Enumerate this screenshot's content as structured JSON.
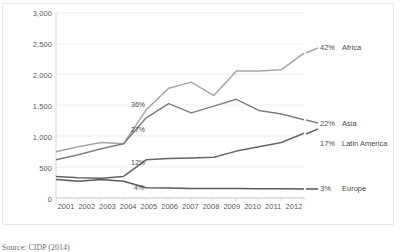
{
  "source_note": "Source: CIDP (2014)",
  "chart_data": {
    "type": "line",
    "title": "",
    "xlabel": "",
    "ylabel": "",
    "grid": true,
    "legend_position": "right-inline-end-labels",
    "categories": [
      "2001",
      "2002",
      "2003",
      "2004",
      "2005",
      "2006",
      "2007",
      "2008",
      "2009",
      "2010",
      "2011",
      "2012"
    ],
    "ylim": [
      0,
      3000
    ],
    "yticks": [
      "0",
      "500",
      "1,000",
      "1,500",
      "2,000",
      "2,500",
      "3,000"
    ],
    "ytick_values": [
      0,
      500,
      1000,
      1500,
      2000,
      2500,
      3000
    ],
    "series": [
      {
        "name": "Africa",
        "color": "#a6a6a6",
        "end_pct": "42%",
        "inline_label": "36%",
        "inline_label_year": "2005",
        "values": [
          750,
          830,
          900,
          880,
          1430,
          1780,
          1880,
          1660,
          2060,
          2060,
          2080,
          2350
        ]
      },
      {
        "name": "Asia",
        "color": "#7f7f7f",
        "end_pct": "22%",
        "inline_label": "27%",
        "inline_label_year": "2005",
        "values": [
          620,
          700,
          800,
          880,
          1300,
          1530,
          1380,
          1490,
          1600,
          1420,
          1360,
          1270
        ]
      },
      {
        "name": "Latin America",
        "color": "#656565",
        "end_pct": "17%",
        "inline_label": "12%",
        "inline_label_year": "2005",
        "values": [
          350,
          330,
          320,
          350,
          620,
          640,
          650,
          660,
          760,
          830,
          900,
          1050
        ]
      },
      {
        "name": "Europe",
        "color": "#5a5a5a",
        "end_pct": "3%",
        "inline_label": "4%",
        "inline_label_year": "2005",
        "values": [
          300,
          270,
          300,
          270,
          165,
          160,
          155,
          155,
          155,
          150,
          150,
          145
        ]
      }
    ]
  }
}
